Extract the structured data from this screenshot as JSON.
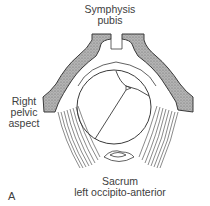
{
  "figure": {
    "panel_letter": "A",
    "labels": {
      "top": [
        "Symphysis",
        "pubis"
      ],
      "left": [
        "Right",
        "pelvic",
        "aspect"
      ],
      "bottom": [
        "Sacrum",
        "left occipito-anterior"
      ]
    },
    "colors": {
      "bone_fill": "#a9a9a9",
      "outline": "#3a3a3a",
      "background": "#ffffff"
    },
    "parts": [
      "symphysis-pubis",
      "pubic-bone-left",
      "pubic-bone-right",
      "fetal-head-circle",
      "sagittal-suture",
      "lambdoid-sutures",
      "posterior-fontanelle",
      "pelvic-floor-fibers",
      "sacrum"
    ]
  }
}
